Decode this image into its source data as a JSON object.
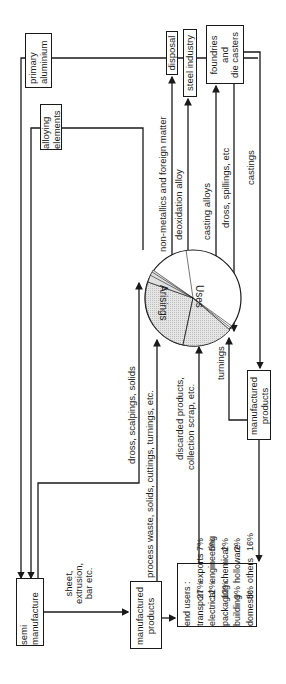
{
  "diagram": {
    "type": "aluminium material flow diagram (rotated 90°)",
    "nodes": {
      "primary_aluminium": "primary\naluminium",
      "alloying_elements": "alloying\nelements",
      "disposal": "disposal",
      "steel_industry": "steel industry",
      "foundries": "foundries\nand\ndie casters",
      "semi_manufacture": "semi\nmanufacture",
      "manufactured_products_left": "manufactured\nproducts",
      "manufactured_products_right": "manufactured\nproducts"
    },
    "pie": {
      "label_uses": "Uses",
      "label_arisings": "Arisings",
      "colors": {
        "arisings_fill": "#d9d9d9",
        "uses_fill": "#ffffff",
        "stroke": "#1a1a1a"
      }
    },
    "flows": {
      "non_metallics": "non-metallics and foreign matter",
      "deoxidation": "deoxidation alloy",
      "casting_alloys": "casting alloys",
      "dross_spillings": "dross, spillings, etc",
      "castings": "castings",
      "dross_scalpings": "dross, scalpings, solids",
      "process_waste": "process waste, solids, cuttings, turnings, etc.",
      "discarded_1": "discarded products,",
      "discarded_2": "collection scrap, etc.",
      "turnings": "turnings",
      "sheet_1": "sheet,",
      "sheet_2": "extrusion,",
      "sheet_3": "bar etc."
    },
    "end_users": {
      "title": "end users :",
      "rows": [
        {
          "left_label": "transport",
          "left_pct": "27%",
          "right_label": "exports",
          "right_pct": "7%"
        },
        {
          "left_label": "electrical",
          "left_pct": "12%",
          "right_label": "engineering",
          "right_pct": "5%"
        },
        {
          "left_label": "packaging",
          "left_pct": "12%",
          "right_label": "chemical",
          "right_pct": "2%"
        },
        {
          "left_label": "building",
          "left_pct": "9%",
          "right_label": "holloware",
          "right_pct": "2%"
        },
        {
          "left_label": "domestic",
          "left_pct": "8%",
          "right_label": "others",
          "right_pct": "16%"
        }
      ]
    }
  }
}
